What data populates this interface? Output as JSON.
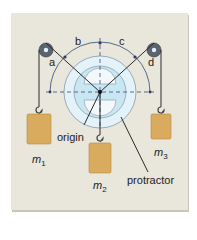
{
  "diagram": {
    "angle_labels": {
      "a": "a",
      "b": "b",
      "c": "c",
      "d": "d"
    },
    "labels": {
      "origin": "origin",
      "protractor": "protractor"
    },
    "masses": [
      {
        "symbol": "m",
        "subscript": "1"
      },
      {
        "symbol": "m",
        "subscript": "2"
      },
      {
        "symbol": "m",
        "subscript": "3"
      }
    ],
    "colors": {
      "background": "#e9e6dc",
      "protractor_fill": "#d8eef7",
      "mass_fill": "#d9ab5e",
      "string": "#333333",
      "arc": "#4a5a7a"
    }
  }
}
